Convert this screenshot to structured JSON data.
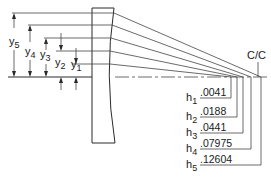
{
  "diagram": {
    "focal_label": "C/C",
    "y_labels": [
      {
        "sym": "y",
        "sub": "5"
      },
      {
        "sym": "y",
        "sub": "4"
      },
      {
        "sym": "y",
        "sub": "3"
      },
      {
        "sym": "y",
        "sub": "2"
      },
      {
        "sym": "y",
        "sub": "1"
      }
    ],
    "h_values": [
      {
        "sym": "h",
        "sub": "1",
        "value": ".0041"
      },
      {
        "sym": "h",
        "sub": "2",
        "value": ".0188"
      },
      {
        "sym": "h",
        "sub": "3",
        "value": ".0441"
      },
      {
        "sym": "h",
        "sub": "4",
        "value": ".07975"
      },
      {
        "sym": "h",
        "sub": "5",
        "value": ".12604"
      }
    ],
    "colors": {
      "ink": "#2a2a2a",
      "background": "#ffffff"
    }
  }
}
